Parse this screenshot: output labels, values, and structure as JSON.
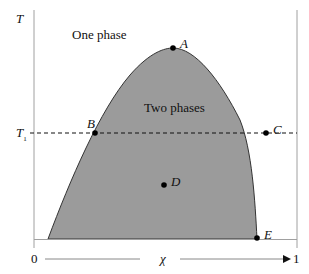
{
  "diagram": {
    "type": "phase-diagram",
    "axis": {
      "y_label": "T",
      "x_label": "χ",
      "x_min_label": "0",
      "x_max_label": "1",
      "temperature_marker": "T",
      "temperature_marker_sub": "1"
    },
    "regions": {
      "outside": "One phase",
      "inside": "Two phases"
    },
    "points": {
      "A": "A",
      "B": "B",
      "C": "C",
      "D": "D",
      "E": "E"
    },
    "colors": {
      "fill": "#9b9b9b",
      "line": "#222222",
      "axis": "#a0a0a0"
    }
  }
}
